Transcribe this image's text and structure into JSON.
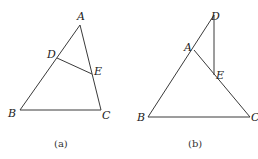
{
  "figures": [
    {
      "id": "a",
      "caption": "(a)",
      "points": {
        "A": {
          "label": "A",
          "x": 80,
          "y": 25
        },
        "B": {
          "label": "B",
          "x": 20,
          "y": 110
        },
        "C": {
          "label": "C",
          "x": 101,
          "y": 110
        },
        "D": {
          "label": "D",
          "x": 57,
          "y": 58
        },
        "E": {
          "label": "E",
          "x": 92,
          "y": 74
        }
      },
      "segments": [
        [
          "A",
          "B"
        ],
        [
          "B",
          "C"
        ],
        [
          "C",
          "A"
        ],
        [
          "D",
          "E"
        ]
      ]
    },
    {
      "id": "b",
      "caption": "(b)",
      "points": {
        "A": {
          "label": "A",
          "x": 194,
          "y": 50
        },
        "B": {
          "label": "B",
          "x": 148,
          "y": 117
        },
        "C": {
          "label": "C",
          "x": 250,
          "y": 117
        },
        "D": {
          "label": "D",
          "x": 214,
          "y": 15
        },
        "E": {
          "label": "E",
          "x": 214,
          "y": 75
        }
      },
      "segments": [
        [
          "D",
          "B"
        ],
        [
          "B",
          "C"
        ],
        [
          "C",
          "A"
        ],
        [
          "D",
          "E"
        ]
      ]
    }
  ]
}
